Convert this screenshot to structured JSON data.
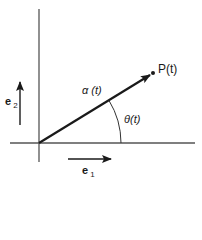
{
  "diagram": {
    "colors": {
      "axis": "#555555",
      "vector": "#1a1a1a",
      "text": "#1a1a1a"
    },
    "origin": {
      "x": 39,
      "y": 143
    },
    "axes": {
      "vertical": {
        "x": 39,
        "y1": 9,
        "y2": 162
      },
      "horizontal": {
        "y": 143,
        "x1": 10,
        "x2": 195
      }
    },
    "vector": {
      "label": "α (t)",
      "from": {
        "x": 39,
        "y": 143
      },
      "to": {
        "x": 150,
        "y": 75
      }
    },
    "point": {
      "label": "P(t)",
      "x": 153,
      "y": 73
    },
    "angle": {
      "label": "θ(t)",
      "radius": 82
    },
    "basis": {
      "e1": {
        "symbol": "e",
        "subscript": "1"
      },
      "e2": {
        "symbol": "e",
        "subscript": "2"
      }
    }
  }
}
